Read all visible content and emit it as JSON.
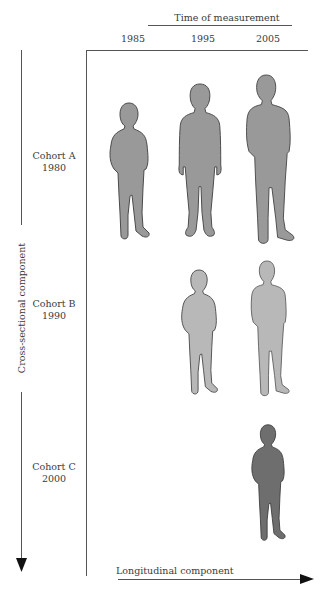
{
  "header": {
    "title": "Time of measurement",
    "years": [
      "1985",
      "1995",
      "2005"
    ]
  },
  "cohorts": [
    {
      "name": "Cohort A",
      "year": "1980"
    },
    {
      "name": "Cohort B",
      "year": "1990"
    },
    {
      "name": "Cohort C",
      "year": "2000"
    }
  ],
  "axes": {
    "vertical_label": "Cross-sectional component",
    "horizontal_label": "Longitudinal component"
  },
  "colors": {
    "cohort_a": "#999999",
    "cohort_b": "#b8b8b8",
    "cohort_c": "#6e6e6e",
    "outline": "#4a4a4a"
  }
}
